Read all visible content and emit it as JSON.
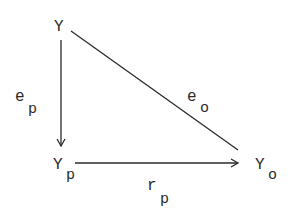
{
  "diagram": {
    "type": "triangle-path-diagram",
    "nodes": {
      "y": {
        "label": "Y",
        "sub": ""
      },
      "yp": {
        "label": "Y",
        "sub": "p"
      },
      "yo": {
        "label": "Y",
        "sub": "o"
      }
    },
    "edges": {
      "ep": {
        "label": "e",
        "sub": "p",
        "from": "Y",
        "to": "Yp",
        "arrow": true
      },
      "eo": {
        "label": "e",
        "sub": "o",
        "from": "Y",
        "to": "Yo",
        "arrow": false
      },
      "rp": {
        "label": "r",
        "sub": "p",
        "from": "Yp",
        "to": "Yo",
        "arrow": true
      }
    },
    "colors": {
      "ink": "#2a2a2a",
      "background": "#ffffff"
    }
  }
}
